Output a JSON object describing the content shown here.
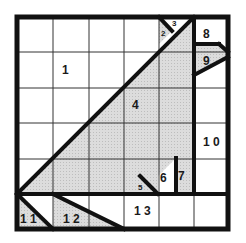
{
  "diagram": {
    "type": "tangram-style dissection puzzle on 6x6 grid",
    "grid": {
      "rows": 6,
      "cols": 6
    },
    "colors": {
      "shaded": "#d6d6d6",
      "line": "#111111",
      "grid": "#333333",
      "background": "#ffffff"
    },
    "regions": [
      {
        "id": "1",
        "label": "1",
        "shaded": false
      },
      {
        "id": "2",
        "label": "2",
        "shaded": true
      },
      {
        "id": "3",
        "label": "3",
        "shaded": false
      },
      {
        "id": "4",
        "label": "4",
        "shaded": true
      },
      {
        "id": "5",
        "label": "5",
        "shaded": true
      },
      {
        "id": "6",
        "label": "6",
        "shaded": false
      },
      {
        "id": "7",
        "label": "7",
        "shaded": true
      },
      {
        "id": "8",
        "label": "8",
        "shaded": false
      },
      {
        "id": "9",
        "label": "9",
        "shaded": true
      },
      {
        "id": "10",
        "label": "1 0",
        "shaded": false
      },
      {
        "id": "11",
        "label": "1 1",
        "shaded": true
      },
      {
        "id": "12",
        "label": "1 2",
        "shaded": true
      },
      {
        "id": "13",
        "label": "1 3",
        "shaded": false
      }
    ]
  }
}
